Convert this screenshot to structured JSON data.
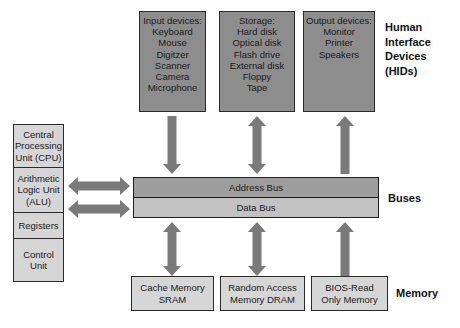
{
  "diagram": {
    "colors": {
      "device_box_fill": "#8d8d8d",
      "memory_box_fill": "#d6d6d6",
      "cpu_box_fill": "#d6d6d6",
      "address_bus_fill": "#9d9d9d",
      "data_bus_fill": "#c2c2c2",
      "arrow_fill": "#7a7a7a",
      "border": "#2b2b2b",
      "text": "#1a1a1a",
      "background": "#ffffff"
    }
  },
  "cpu": {
    "cells": [
      {
        "lines": [
          "Central",
          "Processing",
          "Unit (CPU)"
        ]
      },
      {
        "lines": [
          "Arithmetic",
          "Logic Unit",
          "(ALU)"
        ]
      },
      {
        "lines": [
          "Registers"
        ]
      },
      {
        "lines": [
          "Control",
          "Unit"
        ]
      }
    ]
  },
  "hids": {
    "label_lines": [
      "Human",
      "Interface",
      "Devices",
      "(HIDs)"
    ],
    "boxes": [
      {
        "name": "input-devices",
        "lines": [
          "Input devices:",
          "Keyboard",
          "Mouse",
          "Digitzer",
          "Scanner",
          "Camera",
          "Microphone"
        ]
      },
      {
        "name": "storage",
        "lines": [
          "Storage:",
          "Hard disk",
          "Optical disk",
          "Flash drive",
          "External disk",
          "Floppy",
          "Tape"
        ]
      },
      {
        "name": "output-devices",
        "lines": [
          "Output devices:",
          "Monitor",
          "Printer",
          "Speakers"
        ]
      }
    ]
  },
  "buses": {
    "label": "Buses",
    "lanes": [
      {
        "name": "address-bus",
        "label": "Address Bus"
      },
      {
        "name": "data-bus",
        "label": "Data Bus"
      }
    ]
  },
  "memory": {
    "label": "Memory",
    "boxes": [
      {
        "name": "cache-memory",
        "lines": [
          "Cache Memory",
          "SRAM"
        ]
      },
      {
        "name": "random-access-memory",
        "lines": [
          "Random Access",
          "Memory DRAM"
        ]
      },
      {
        "name": "bios-rom",
        "lines": [
          "BIOS-Read",
          "Only Memory"
        ]
      }
    ]
  },
  "arrows": [
    {
      "name": "arrow-input-to-bus",
      "direction": "down"
    },
    {
      "name": "arrow-storage-to-bus",
      "direction": "both-vertical"
    },
    {
      "name": "arrow-output-from-bus",
      "direction": "up"
    },
    {
      "name": "arrow-cpu-bus-upper",
      "direction": "both-horizontal"
    },
    {
      "name": "arrow-cpu-bus-lower",
      "direction": "both-horizontal"
    },
    {
      "name": "arrow-bus-to-cache",
      "direction": "both-vertical"
    },
    {
      "name": "arrow-bus-to-ram",
      "direction": "both-vertical"
    },
    {
      "name": "arrow-bios-to-bus",
      "direction": "up"
    }
  ]
}
